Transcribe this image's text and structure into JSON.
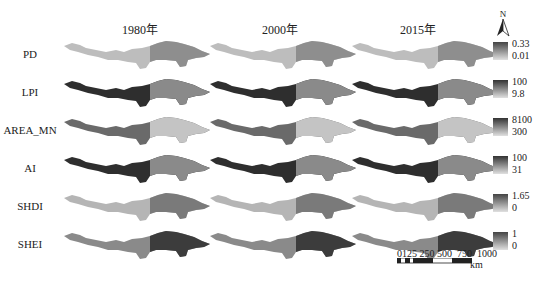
{
  "columns": [
    "1980年",
    "2000年",
    "2015年"
  ],
  "rows": [
    {
      "label": "PD",
      "legend_max": "0.33",
      "legend_min": "0.01",
      "west_tone": "#bdbdbd",
      "east_tone": "#8e8e8e",
      "legend_dark": "#444444"
    },
    {
      "label": "LPI",
      "legend_max": "100",
      "legend_min": "9.8",
      "west_tone": "#2e2e2e",
      "east_tone": "#8a8a8a",
      "legend_dark": "#333333"
    },
    {
      "label": "AREA_MN",
      "legend_max": "8100",
      "legend_min": "300",
      "west_tone": "#6a6a6a",
      "east_tone": "#c4c4c4",
      "legend_dark": "#333333"
    },
    {
      "label": "AI",
      "legend_max": "100",
      "legend_min": "31",
      "west_tone": "#2e2e2e",
      "east_tone": "#8a8a8a",
      "legend_dark": "#333333"
    },
    {
      "label": "SHDI",
      "legend_max": "1.65",
      "legend_min": "0",
      "west_tone": "#b5b5b5",
      "east_tone": "#7a7a7a",
      "legend_dark": "#444444"
    },
    {
      "label": "SHEI",
      "legend_max": "1",
      "legend_min": "0",
      "west_tone": "#8a8a8a",
      "east_tone": "#3c3c3c",
      "legend_dark": "#444444"
    }
  ],
  "north_arrow": {
    "label": "N"
  },
  "scale_bar": {
    "ticks": [
      "0",
      "125",
      "250",
      "500",
      "750",
      "1000"
    ],
    "unit": "km"
  }
}
